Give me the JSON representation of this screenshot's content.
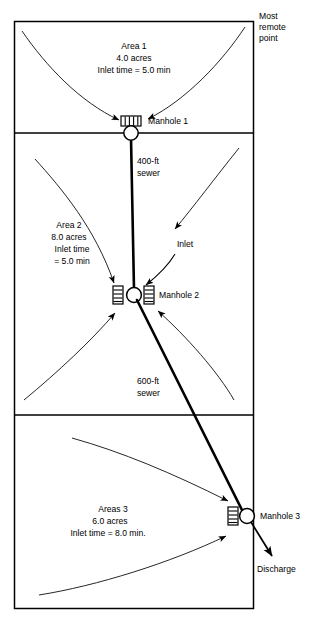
{
  "figure": {
    "type": "engineering-diagram",
    "stroke_color": "#000000",
    "background_color": "#ffffff"
  },
  "annotations": {
    "most_remote_point": "Most\nremote\npoint",
    "most_remote_point_line1": "Most",
    "most_remote_point_line2": "remote",
    "most_remote_point_line3": "point",
    "inlet_label": "Inlet",
    "discharge_label": "Discharge"
  },
  "areas": [
    {
      "id": "area-1",
      "name": "Area 1",
      "acreage": "4.0 acres",
      "inlet_time": "Inlet time = 5.0 min",
      "lines": [
        "Area 1",
        "4.0 acres",
        "Inlet time = 5.0 min"
      ]
    },
    {
      "id": "area-2",
      "name": "Area 2",
      "acreage": "8.0 acres",
      "inlet_time_line1": "Inlet time",
      "inlet_time_line2": "= 5.0 min",
      "lines": [
        "Area 2",
        "8.0 acres",
        "Inlet time",
        "= 5.0 min"
      ]
    },
    {
      "id": "area-3",
      "name": "Areas 3",
      "acreage": "6.0 acres",
      "inlet_time": "Inlet time = 8.0 min.",
      "lines": [
        "Areas 3",
        "6.0 acres",
        "Inlet time = 8.0 min."
      ]
    }
  ],
  "manholes": [
    {
      "id": "manhole-1",
      "label": "Manhole 1",
      "x": 131,
      "y": 133
    },
    {
      "id": "manhole-2",
      "label": "Manhole 2",
      "x": 134,
      "y": 294
    },
    {
      "id": "manhole-3",
      "label": "Manhole 3",
      "x": 246,
      "y": 516
    }
  ],
  "sewers": [
    {
      "id": "sewer-400",
      "length_label_line1": "400-ft",
      "length_label_line2": "sewer",
      "from": "manhole-1",
      "to": "manhole-2"
    },
    {
      "id": "sewer-600",
      "length_label_line1": "600-ft",
      "length_label_line2": "sewer",
      "from": "manhole-2",
      "to": "manhole-3"
    }
  ]
}
